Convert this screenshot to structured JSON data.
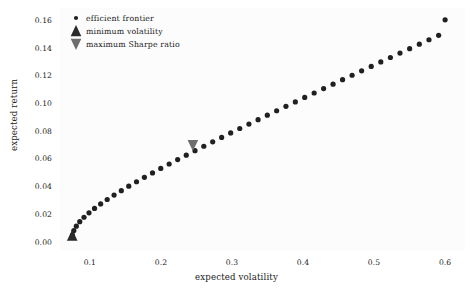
{
  "chart_data": {
    "type": "scatter",
    "title": "",
    "xlabel": "expected volatility",
    "ylabel": "expected return",
    "xlim": [
      0.058,
      0.628
    ],
    "ylim": [
      -0.006,
      0.1685
    ],
    "xticks": [
      0.1,
      0.2,
      0.3,
      0.4,
      0.5,
      0.6
    ],
    "xtick_labels": [
      "0.1",
      "0.2",
      "0.3",
      "0.4",
      "0.5",
      "0.6"
    ],
    "yticks": [
      0.0,
      0.02,
      0.04,
      0.06,
      0.08,
      0.1,
      0.12,
      0.14,
      0.16
    ],
    "ytick_labels": [
      "0.00",
      "0.02",
      "0.04",
      "0.06",
      "0.08",
      "0.10",
      "0.12",
      "0.14",
      "0.16"
    ],
    "grid": false,
    "legend_position": "upper left",
    "series": [
      {
        "name": "efficient frontier",
        "marker": "circle",
        "color": "#202020",
        "markersize": 2.6,
        "x": [
          0.0755,
          0.0775,
          0.081,
          0.0858,
          0.0918,
          0.0988,
          0.1066,
          0.1152,
          0.1244,
          0.1341,
          0.1443,
          0.1548,
          0.1657,
          0.1768,
          0.1882,
          0.1998,
          0.2116,
          0.2236,
          0.2357,
          0.248,
          0.2604,
          0.2729,
          0.2855,
          0.2982,
          0.311,
          0.3239,
          0.3368,
          0.3498,
          0.3629,
          0.376,
          0.3892,
          0.4024,
          0.4157,
          0.429,
          0.4423,
          0.4557,
          0.4691,
          0.4825,
          0.496,
          0.5095,
          0.523,
          0.5365,
          0.5501,
          0.5637,
          0.5773,
          0.5909,
          0.6
        ],
        "y": [
          0.0048,
          0.008,
          0.0112,
          0.0144,
          0.0176,
          0.0208,
          0.024,
          0.0272,
          0.0304,
          0.0336,
          0.0368,
          0.04,
          0.0432,
          0.0464,
          0.0496,
          0.0528,
          0.056,
          0.0592,
          0.0624,
          0.0656,
          0.0688,
          0.072,
          0.0752,
          0.0784,
          0.0816,
          0.0848,
          0.088,
          0.0912,
          0.0944,
          0.0976,
          0.1008,
          0.104,
          0.1072,
          0.1104,
          0.1136,
          0.1168,
          0.12,
          0.1232,
          0.1264,
          0.1296,
          0.1328,
          0.136,
          0.1392,
          0.1424,
          0.1456,
          0.1488,
          0.16
        ]
      },
      {
        "name": "minimum volatility",
        "marker": "triangle-up",
        "color": "#2b2b2b",
        "markersize": 11,
        "x": [
          0.0752
        ],
        "y": [
          0.004
        ]
      },
      {
        "name": "maximum Sharpe ratio",
        "marker": "triangle-down",
        "color": "#6e6e6e",
        "markersize": 11,
        "x": [
          0.245
        ],
        "y": [
          0.07
        ]
      }
    ]
  },
  "legend": {
    "items": [
      {
        "label": "efficient frontier",
        "marker": "circle",
        "color": "#202020"
      },
      {
        "label": "minimum volatility",
        "marker": "triangle-up",
        "color": "#2b2b2b"
      },
      {
        "label": "maximum Sharpe ratio",
        "marker": "triangle-down",
        "color": "#6e6e6e"
      }
    ]
  },
  "axes": {
    "xlabel": "expected volatility",
    "ylabel": "expected return"
  }
}
